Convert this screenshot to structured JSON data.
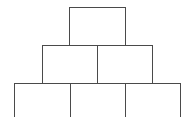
{
  "diagram": {
    "type": "pyramid-of-boxes",
    "line_color": "#4a4a4a",
    "background": "#ffffff",
    "rows": [
      {
        "name": "top",
        "boxes": [
          {
            "label": ""
          }
        ]
      },
      {
        "name": "middle",
        "boxes": [
          {
            "label": ""
          },
          {
            "label": ""
          }
        ]
      },
      {
        "name": "bottom",
        "boxes": [
          {
            "label": ""
          },
          {
            "label": ""
          },
          {
            "label": ""
          }
        ]
      }
    ]
  }
}
